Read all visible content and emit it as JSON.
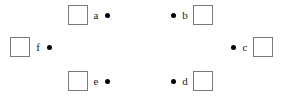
{
  "figure": {
    "width": 287,
    "height": 99,
    "background_color": "#ffffff",
    "square_border_color": "#7a7a7a",
    "square_fill_color": "#ffffff",
    "dot_color": "#000000",
    "label_color": "#1a1a1a"
  },
  "nodes": [
    {
      "id": "a",
      "label": "a",
      "order": "square-label-dot",
      "x": 68,
      "y": 5,
      "square_size": 20
    },
    {
      "id": "b",
      "label": "b",
      "order": "dot-label-square",
      "x": 170,
      "y": 5,
      "square_size": 20
    },
    {
      "id": "c",
      "label": "c",
      "order": "dot-label-square",
      "x": 230,
      "y": 37,
      "square_size": 20
    },
    {
      "id": "d",
      "label": "d",
      "order": "dot-label-square",
      "x": 170,
      "y": 71,
      "square_size": 20
    },
    {
      "id": "e",
      "label": "e",
      "order": "square-label-dot",
      "x": 68,
      "y": 71,
      "square_size": 20
    },
    {
      "id": "f",
      "label": "f",
      "order": "square-label-dot",
      "x": 10,
      "y": 37,
      "square_size": 20
    }
  ]
}
